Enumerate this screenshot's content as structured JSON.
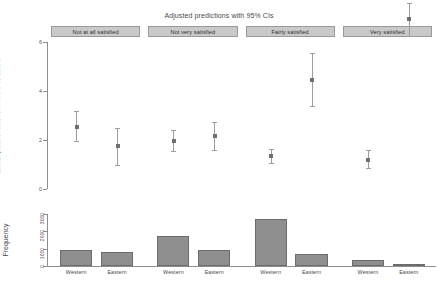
{
  "chart_data": [
    {
      "type": "scatter",
      "title": "Adjusted predictions with 95% CIs",
      "xlabel": "",
      "ylabel": "Linear pred. of vote for PRRPs vs others",
      "ylim": [
        0,
        6
      ],
      "yticks": [
        0,
        2,
        4,
        6
      ],
      "ytick_labels": [
        "0",
        "2",
        "4",
        "6"
      ],
      "grid": false,
      "panels": [
        {
          "label": "Not at all satisfied",
          "categories": [
            "Western",
            "Eastern"
          ],
          "values": [
            2.55,
            1.75
          ],
          "ci_low": [
            1.95,
            1.0
          ],
          "ci_high": [
            3.2,
            2.5
          ]
        },
        {
          "label": "Not very satisfied",
          "categories": [
            "Western",
            "Eastern"
          ],
          "values": [
            1.95,
            2.15
          ],
          "ci_low": [
            1.55,
            1.6
          ],
          "ci_high": [
            2.4,
            2.75
          ]
        },
        {
          "label": "Fairly satisfied",
          "categories": [
            "Western",
            "Eastern"
          ],
          "values": [
            1.35,
            4.45
          ],
          "ci_low": [
            1.05,
            3.4
          ],
          "ci_high": [
            1.65,
            5.55
          ]
        },
        {
          "label": "Very satisfied",
          "categories": [
            "Western",
            "Eastern"
          ],
          "values": [
            1.2,
            6.95
          ],
          "ci_low": [
            0.85,
            6.25
          ],
          "ci_high": [
            1.6,
            7.6
          ]
        }
      ]
    },
    {
      "type": "bar",
      "title": "",
      "xlabel": "",
      "ylabel": "Frequency",
      "ylim": [
        0,
        3000
      ],
      "yticks": [
        0,
        1000,
        2000,
        3000
      ],
      "ytick_labels": [
        "0",
        "1000",
        "2000",
        "3000"
      ],
      "grid": false,
      "panels": [
        {
          "label": "Not at all satisfied",
          "categories": [
            "Western",
            "Eastern"
          ],
          "values": [
            900,
            820
          ]
        },
        {
          "label": "Not very satisfied",
          "categories": [
            "Western",
            "Eastern"
          ],
          "values": [
            1760,
            940
          ]
        },
        {
          "label": "Fairly satisfied",
          "categories": [
            "Western",
            "Eastern"
          ],
          "values": [
            2720,
            690
          ]
        },
        {
          "label": "Very satisfied",
          "categories": [
            "Western",
            "Eastern"
          ],
          "values": [
            360,
            60
          ]
        }
      ]
    }
  ],
  "figure": {
    "title": "Adjusted predictions with 95% CIs",
    "upper_ylabel": "Linear pred. of vote for PRRPs vs others",
    "lower_ylabel": "Frequency",
    "strips": [
      "Not at all satisfied",
      "Not very satisfied",
      "Fairly satisfied",
      "Very satisfied"
    ],
    "upper_yticks": [
      "6",
      "4",
      "2",
      "0"
    ],
    "lower_yticks": [
      "3000",
      "2000",
      "1000",
      "0"
    ],
    "x_categories": [
      "Western",
      "Eastern",
      "Western",
      "Eastern",
      "Western",
      "Eastern",
      "Western",
      "Eastern"
    ],
    "colors": {
      "marker": "#6f6f6f",
      "ci": "#9d9d9d",
      "bar_fill": "#8f8f8f",
      "bar_edge": "#6c6c6c",
      "strip_fill": "#c9c9c9",
      "strip_edge": "#9a9a9a",
      "axis": "#8e8e8e",
      "text": "#4a4a4a"
    }
  }
}
